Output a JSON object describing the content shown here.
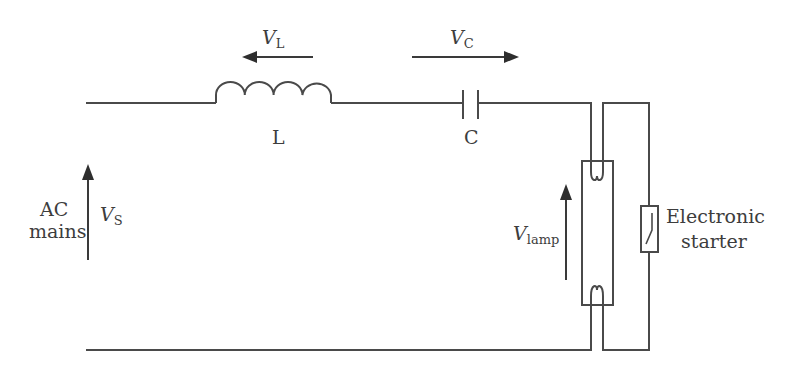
{
  "diagram": {
    "components": {
      "inductor": {
        "label": "L",
        "voltage_symbol": "V",
        "voltage_sub": "L"
      },
      "capacitor": {
        "label": "C",
        "voltage_symbol": "V",
        "voltage_sub": "C"
      },
      "source": {
        "label_line1": "AC",
        "label_line2": "mains",
        "voltage_symbol": "V",
        "voltage_sub": "S"
      },
      "lamp": {
        "voltage_symbol": "V",
        "voltage_sub": "lamp"
      },
      "starter": {
        "label_line1": "Electronic",
        "label_line2": "starter"
      }
    },
    "arrows": {
      "VL_direction": "left",
      "VC_direction": "right",
      "VS_direction": "up",
      "Vlamp_direction": "up"
    },
    "colors": {
      "line": "#4a4a4a",
      "text": "#3d3d3d",
      "background": "#ffffff"
    }
  }
}
